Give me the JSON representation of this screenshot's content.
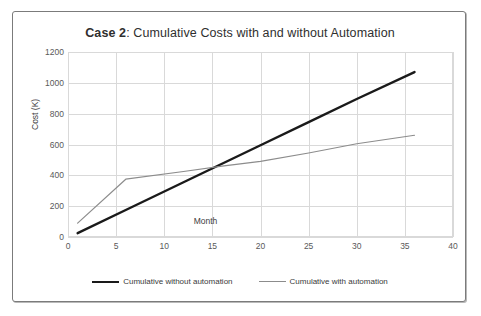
{
  "figure": {
    "title_bold": "Case 2",
    "title_rest": ": Cumulative Costs with and without Automation",
    "border_color": "#7b7b7b",
    "background": "#ffffff"
  },
  "legend": {
    "position": "bottom-center",
    "entries": [
      {
        "label": "Cumulative without automation",
        "color": "#1a1a1a",
        "style": "thick"
      },
      {
        "label": "Cumulative with automation",
        "color": "#8c8c8c",
        "style": "thin"
      }
    ]
  },
  "chart_data": {
    "type": "line",
    "title": "Case 2: Cumulative Costs with and without Automation",
    "xlabel": "Month",
    "ylabel": "Cost (K)",
    "xlim": [
      0,
      40
    ],
    "ylim": [
      0,
      1200
    ],
    "xticks": [
      0,
      5,
      10,
      15,
      20,
      25,
      30,
      35,
      40
    ],
    "yticks": [
      0,
      200,
      400,
      600,
      800,
      1000,
      1200
    ],
    "grid": true,
    "gridline_color": "#d9d9d9",
    "series": [
      {
        "name": "Cumulative without automation",
        "color": "#1a1a1a",
        "width": 2.4,
        "x": [
          1,
          6,
          12,
          16,
          20,
          25,
          30,
          36
        ],
        "values": [
          25,
          175,
          355,
          475,
          595,
          745,
          895,
          1070
        ]
      },
      {
        "name": "Cumulative with automation",
        "color": "#8c8c8c",
        "width": 1.2,
        "x": [
          1,
          6,
          12,
          16,
          20,
          25,
          30,
          36
        ],
        "values": [
          90,
          375,
          425,
          460,
          490,
          545,
          605,
          660
        ]
      }
    ],
    "annotations": {
      "crossover_month": 16,
      "crossover_cost": 465
    }
  }
}
